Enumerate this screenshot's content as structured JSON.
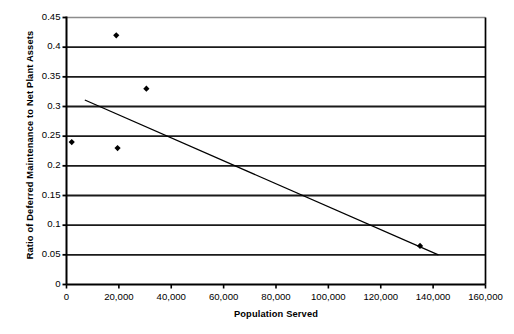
{
  "chart_data": {
    "type": "scatter",
    "title": "",
    "xlabel": "Population Served",
    "ylabel": "Ratio of Deferred Maintenance to Net Plant Assets",
    "xlim": [
      0,
      160000
    ],
    "ylim": [
      0,
      0.45
    ],
    "xticks": [
      0,
      20000,
      40000,
      60000,
      80000,
      100000,
      120000,
      140000,
      160000
    ],
    "xticklabels": [
      "0",
      "20,000",
      "40,000",
      "60,000",
      "80,000",
      "100,000",
      "120,000",
      "140,000",
      "160,000"
    ],
    "yticks": [
      0,
      0.05,
      0.1,
      0.15,
      0.2,
      0.25,
      0.3,
      0.35,
      0.4,
      0.45
    ],
    "yticklabels": [
      "0",
      "0.05",
      "0.1",
      "0.15",
      "0.2",
      "0.25",
      "0.3",
      "0.35",
      "0.4",
      "0.45"
    ],
    "grid": "horizontal",
    "legend": "none",
    "series": [
      {
        "name": "Utilities",
        "marker": "filled-diamond",
        "color": "#000000",
        "points": [
          {
            "x": 2000,
            "y": 0.24
          },
          {
            "x": 19000,
            "y": 0.42
          },
          {
            "x": 19500,
            "y": 0.23
          },
          {
            "x": 30500,
            "y": 0.33
          },
          {
            "x": 135000,
            "y": 0.065
          }
        ]
      }
    ],
    "trendline": {
      "name": "Linear trend",
      "color": "#000000",
      "x_start": 7000,
      "y_start": 0.311,
      "x_end": 142000,
      "y_end": 0.05
    },
    "colors": {
      "axis": "#000000",
      "gridline": "#1a1a1a",
      "top_frame": "#8c8c8c",
      "marker": "#000000",
      "background": "#ffffff"
    }
  }
}
